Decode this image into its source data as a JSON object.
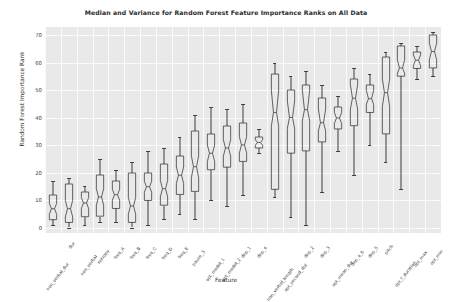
{
  "chart_data": {
    "type": "box",
    "title": "Median and Variance for Random Forest Feature Importance Ranks on All Data",
    "xlabel": "Feature",
    "ylabel": "Random Forest Importance Rank",
    "ylim": [
      -2,
      73
    ],
    "yticks": [
      0,
      10,
      20,
      30,
      40,
      50,
      60,
      70
    ],
    "grid": true,
    "notched": true,
    "legend": null,
    "categories": [
      "non_verbal_dur",
      "dur",
      "non_verbal",
      "entropy",
      "freq_A",
      "freq_B",
      "freq_C",
      "freq_D",
      "freq_E",
      "pause_3",
      "opt_model_1",
      "opt_model_2",
      "dep_1",
      "dep_4",
      "non_verbal_length",
      "opt_second_dur",
      "dep_2",
      "dep_3",
      "opt_mean_dur",
      "dep_4_b",
      "dep_5",
      "pitch",
      "opt_f_duration",
      "opt_max",
      "opt_min"
    ],
    "boxes": [
      {
        "name": "non_verbal_dur",
        "whisker_low": 1,
        "q1": 3,
        "median": 7,
        "q3": 12,
        "whisker_high": 17,
        "notch_low": 5,
        "notch_high": 9
      },
      {
        "name": "dur",
        "whisker_low": 0,
        "q1": 2,
        "median": 7,
        "q3": 16,
        "whisker_high": 18,
        "notch_low": 4,
        "notch_high": 10
      },
      {
        "name": "non_verbal",
        "whisker_low": 1,
        "q1": 4,
        "median": 9,
        "q3": 13,
        "whisker_high": 15,
        "notch_low": 7,
        "notch_high": 11
      },
      {
        "name": "entropy",
        "whisker_low": 2,
        "q1": 4,
        "median": 11,
        "q3": 19,
        "whisker_high": 25,
        "notch_low": 8,
        "notch_high": 14
      },
      {
        "name": "freq_A",
        "whisker_low": 2,
        "q1": 7,
        "median": 12,
        "q3": 17,
        "whisker_high": 21,
        "notch_low": 10,
        "notch_high": 14
      },
      {
        "name": "freq_B",
        "whisker_low": 0,
        "q1": 2,
        "median": 8,
        "q3": 20,
        "whisker_high": 24,
        "notch_low": 5,
        "notch_high": 11
      },
      {
        "name": "freq_C",
        "whisker_low": 1,
        "q1": 10,
        "median": 15,
        "q3": 20,
        "whisker_high": 28,
        "notch_low": 13,
        "notch_high": 17
      },
      {
        "name": "freq_D",
        "whisker_low": 3,
        "q1": 8,
        "median": 14,
        "q3": 23,
        "whisker_high": 29,
        "notch_low": 11,
        "notch_high": 17
      },
      {
        "name": "freq_E",
        "whisker_low": 5,
        "q1": 12,
        "median": 19,
        "q3": 26,
        "whisker_high": 33,
        "notch_low": 16,
        "notch_high": 22
      },
      {
        "name": "pause_3",
        "whisker_low": 3,
        "q1": 13,
        "median": 22,
        "q3": 35,
        "whisker_high": 41,
        "notch_low": 18,
        "notch_high": 26
      },
      {
        "name": "opt_model_1",
        "whisker_low": 10,
        "q1": 21,
        "median": 27,
        "q3": 34,
        "whisker_high": 44,
        "notch_low": 24,
        "notch_high": 30
      },
      {
        "name": "opt_model_2",
        "whisker_low": 8,
        "q1": 22,
        "median": 29,
        "q3": 37,
        "whisker_high": 43,
        "notch_low": 26,
        "notch_high": 32
      },
      {
        "name": "dep_1",
        "whisker_low": 12,
        "q1": 24,
        "median": 30,
        "q3": 38,
        "whisker_high": 45,
        "notch_low": 27,
        "notch_high": 33
      },
      {
        "name": "dep_4",
        "whisker_low": 27,
        "q1": 29,
        "median": 31,
        "q3": 33,
        "whisker_high": 36,
        "notch_low": 30,
        "notch_high": 32
      },
      {
        "name": "non_verbal_length",
        "whisker_low": 11,
        "q1": 14,
        "median": 42,
        "q3": 56,
        "whisker_high": 60,
        "notch_low": 37,
        "notch_high": 50
      },
      {
        "name": "opt_second_dur",
        "whisker_low": 4,
        "q1": 27,
        "median": 40,
        "q3": 50,
        "whisker_high": 55,
        "notch_low": 36,
        "notch_high": 46
      },
      {
        "name": "dep_2",
        "whisker_low": 1,
        "q1": 28,
        "median": 43,
        "q3": 52,
        "whisker_high": 57,
        "notch_low": 39,
        "notch_high": 50
      },
      {
        "name": "dep_3",
        "whisker_low": 13,
        "q1": 31,
        "median": 38,
        "q3": 47,
        "whisker_high": 52,
        "notch_low": 35,
        "notch_high": 43
      },
      {
        "name": "opt_mean_dur",
        "whisker_low": 28,
        "q1": 36,
        "median": 40,
        "q3": 44,
        "whisker_high": 48,
        "notch_low": 38,
        "notch_high": 42
      },
      {
        "name": "dep_4_b",
        "whisker_low": 19,
        "q1": 37,
        "median": 47,
        "q3": 54,
        "whisker_high": 58,
        "notch_low": 43,
        "notch_high": 52
      },
      {
        "name": "dep_5",
        "whisker_low": 30,
        "q1": 42,
        "median": 47,
        "q3": 52,
        "whisker_high": 56,
        "notch_low": 45,
        "notch_high": 50
      },
      {
        "name": "pitch",
        "whisker_low": 24,
        "q1": 34,
        "median": 49,
        "q3": 62,
        "whisker_high": 64,
        "notch_low": 44,
        "notch_high": 54
      },
      {
        "name": "opt_f_duration",
        "whisker_low": 14,
        "q1": 55,
        "median": 58,
        "q3": 66,
        "whisker_high": 67,
        "notch_low": 56,
        "notch_high": 61
      },
      {
        "name": "opt_max",
        "whisker_low": 54,
        "q1": 58,
        "median": 61,
        "q3": 64,
        "whisker_high": 66,
        "notch_low": 59,
        "notch_high": 63
      },
      {
        "name": "opt_min",
        "whisker_low": 55,
        "q1": 58,
        "median": 64,
        "q3": 70,
        "whisker_high": 71,
        "notch_low": 61,
        "notch_high": 67
      }
    ]
  },
  "style": {
    "axes_facecolor": "#e9e9e9",
    "grid_color": "#fbfbfb",
    "line_color": "#3d3d3d",
    "text_color": "#2b2b2b",
    "figure_facecolor": "#ffffff"
  }
}
